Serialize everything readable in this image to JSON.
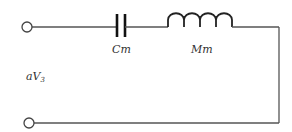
{
  "diagram": {
    "type": "circuit",
    "components": [
      {
        "id": "Cm",
        "kind": "capacitor",
        "label": "Cm"
      },
      {
        "id": "Mm",
        "kind": "inductor",
        "label": "Mm"
      }
    ],
    "source_label": {
      "main": "aV",
      "subscript": "3"
    },
    "terminals": [
      "top-left",
      "bottom-left"
    ],
    "colors": {
      "wire": "#555555",
      "component": "#111111",
      "background": "#ffffff"
    }
  }
}
